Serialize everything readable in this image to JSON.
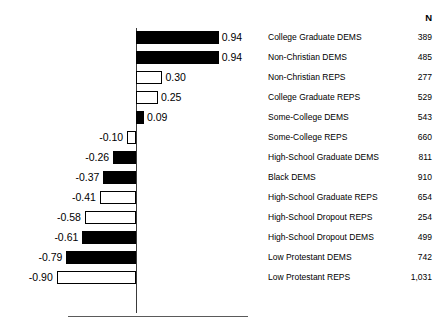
{
  "chart_title": "",
  "columns": {
    "n_header": "N"
  },
  "chart_data": {
    "type": "bar",
    "orientation": "horizontal",
    "title": "",
    "xlabel": "",
    "ylabel": "",
    "xlim": [
      -1.0,
      1.0
    ],
    "grid": false,
    "legend": null,
    "zero_line": true,
    "value_label_format": "0.00",
    "series_encoding": {
      "black_fill": "DEMS",
      "white_fill": "REPS"
    },
    "categories": [
      "College Graduate DEMS",
      "Non-Christian DEMS",
      "Non-Christian REPS",
      "College Graduate REPS",
      "Some-College DEMS",
      "Some-College REPS",
      "High-School Graduate DEMS",
      "Black DEMS",
      "High-School Graduate REPS",
      "High-School Dropout REPS",
      "High-School Dropout DEMS",
      "Low Protestant DEMS",
      "Low Protestant REPS"
    ],
    "values": [
      0.94,
      0.94,
      0.3,
      0.25,
      0.09,
      -0.1,
      -0.26,
      -0.37,
      -0.41,
      -0.58,
      -0.61,
      -0.79,
      -0.9
    ],
    "value_labels": [
      "0.94",
      "0.94",
      "0.30",
      "0.25",
      "0.09",
      "-0.10",
      "-0.26",
      "-0.37",
      "-0.41",
      "-0.58",
      "-0.61",
      "-0.79",
      "-0.90"
    ],
    "fills": [
      "black",
      "black",
      "white",
      "white",
      "black",
      "white",
      "black",
      "black",
      "white",
      "white",
      "black",
      "black",
      "white"
    ],
    "n": [
      389,
      485,
      277,
      529,
      543,
      660,
      811,
      910,
      654,
      254,
      499,
      742,
      1031
    ],
    "n_labels": [
      "389",
      "485",
      "277",
      "529",
      "543",
      "660",
      "811",
      "910",
      "654",
      "254",
      "499",
      "742",
      "1,031"
    ]
  }
}
